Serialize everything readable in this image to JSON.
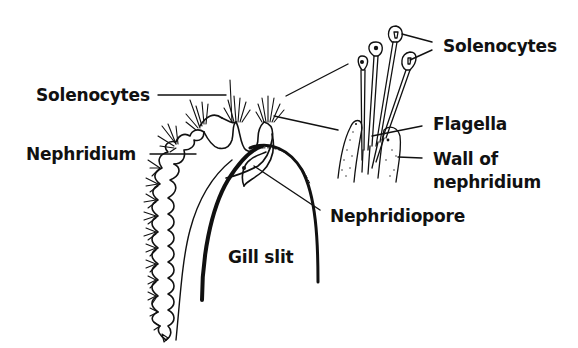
{
  "diagram": {
    "labels": {
      "solenocytes_left": "Solenocytes",
      "solenocytes_right": "Solenocytes",
      "nephridium": "Nephridium",
      "flagella": "Flagella",
      "wall_line1": "Wall of",
      "wall_line2": "nephridium",
      "nephridiopore": "Nephridiopore",
      "gill_slit": "Gill slit"
    },
    "colors": {
      "ink": "#111111",
      "background": "#ffffff"
    }
  }
}
